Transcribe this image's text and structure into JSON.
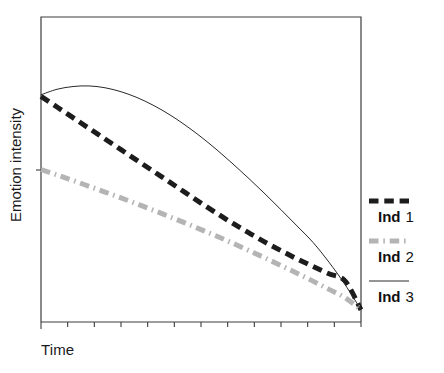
{
  "chart_data": {
    "type": "line",
    "title": "",
    "xlabel": "Time",
    "ylabel": "Emotion intensity",
    "grid": false,
    "legend_position": "right",
    "xlim": [
      0,
      100
    ],
    "ylim": [
      0,
      100
    ],
    "axis_tick_labels": {
      "x": [],
      "y": []
    },
    "x_tick_count": 13,
    "y_tick_count": 1,
    "x": [
      0,
      5,
      10,
      15,
      20,
      25,
      30,
      35,
      40,
      45,
      50,
      55,
      60,
      65,
      70,
      75,
      80,
      85,
      90,
      95,
      100
    ],
    "series": [
      {
        "name": "Ind 1",
        "style": "dashed",
        "color": "#1c1c1c",
        "width": 5,
        "values": [
          74,
          70.5,
          67,
          63.5,
          60,
          56.5,
          53,
          49.5,
          46,
          42.5,
          39,
          35.6,
          32.3,
          29.2,
          26.2,
          23.4,
          20.7,
          18.2,
          15.8,
          13.5,
          4
        ]
      },
      {
        "name": "Ind 2",
        "style": "dash-dot",
        "color": "#b4b4b4",
        "width": 5,
        "values": [
          50,
          48.2,
          46.4,
          44.5,
          42.6,
          40.7,
          38.7,
          36.7,
          34.6,
          32.5,
          30.3,
          28.1,
          25.8,
          23.4,
          21,
          18.5,
          16,
          13.4,
          10.7,
          8,
          4
        ]
      },
      {
        "name": "Ind 3",
        "style": "solid",
        "color": "#2a2a2a",
        "width": 1,
        "values": [
          74.5,
          76.3,
          77.2,
          77.4,
          76.8,
          75.5,
          73.6,
          71.1,
          68.1,
          64.6,
          60.7,
          56.4,
          51.8,
          47,
          42,
          36.8,
          31.5,
          26.1,
          19.6,
          12.3,
          4
        ]
      }
    ]
  },
  "legend": {
    "entries": [
      {
        "label": "Ind",
        "index": "1",
        "sample": "dashed-thick-black"
      },
      {
        "label": "Ind",
        "index": "2",
        "sample": "dashdot-gray"
      },
      {
        "label": "Ind",
        "index": "3",
        "sample": "solid-thin-black"
      }
    ]
  },
  "colors": {
    "axis": "#3c3c3c",
    "series_1": "#1c1c1c",
    "series_2": "#b4b4b4",
    "series_3": "#2a2a2a",
    "text": "#1a1a1a",
    "background": "#ffffff"
  }
}
